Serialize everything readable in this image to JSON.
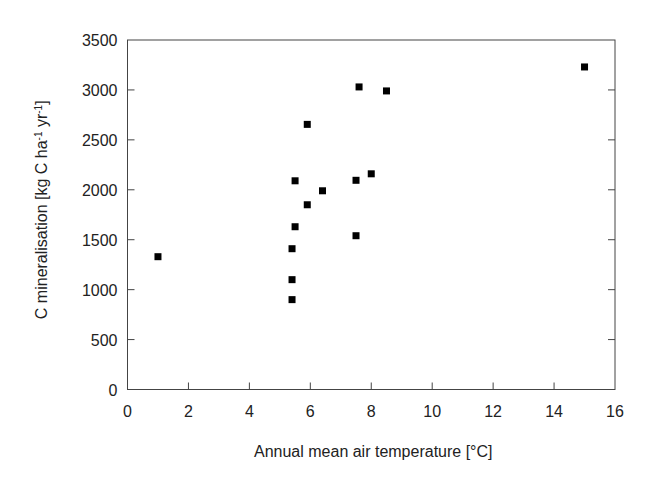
{
  "chart_data": {
    "type": "scatter",
    "title": "",
    "xlabel": "Annual mean air temperature [°C]",
    "ylabel": "C mineralisation [kg C ha⁻¹ yr⁻¹]",
    "xlim": [
      0,
      16
    ],
    "ylim": [
      0,
      3500
    ],
    "x_ticks": [
      0,
      2,
      4,
      6,
      8,
      10,
      12,
      14,
      16
    ],
    "y_ticks": [
      0,
      500,
      1000,
      1500,
      2000,
      2500,
      3000,
      3500
    ],
    "grid": false,
    "legend": null,
    "marker": "filled-square",
    "marker_color": "#000000",
    "series": [
      {
        "name": "sites",
        "points": [
          {
            "x": 1.0,
            "y": 1330
          },
          {
            "x": 5.4,
            "y": 900
          },
          {
            "x": 5.4,
            "y": 1100
          },
          {
            "x": 5.4,
            "y": 1410
          },
          {
            "x": 5.5,
            "y": 1630
          },
          {
            "x": 5.5,
            "y": 2090
          },
          {
            "x": 5.9,
            "y": 1850
          },
          {
            "x": 5.9,
            "y": 2655
          },
          {
            "x": 6.4,
            "y": 1990
          },
          {
            "x": 7.5,
            "y": 1540
          },
          {
            "x": 7.5,
            "y": 2095
          },
          {
            "x": 8.0,
            "y": 2160
          },
          {
            "x": 7.6,
            "y": 3030
          },
          {
            "x": 8.5,
            "y": 2990
          },
          {
            "x": 15.0,
            "y": 3230
          }
        ]
      }
    ]
  },
  "labels": {
    "xlabel": "Annual mean air temperature [°C]",
    "ylabel_main": "C mineralisation [kg C ha",
    "ylabel_sup1": "-1",
    "ylabel_mid": " yr",
    "ylabel_sup2": "-1",
    "ylabel_end": "]"
  },
  "layout": {
    "plot": {
      "left": 127.5,
      "right": 615,
      "top": 40,
      "bottom": 389.5
    },
    "axis_color": "#444444",
    "tick_length": 7
  }
}
